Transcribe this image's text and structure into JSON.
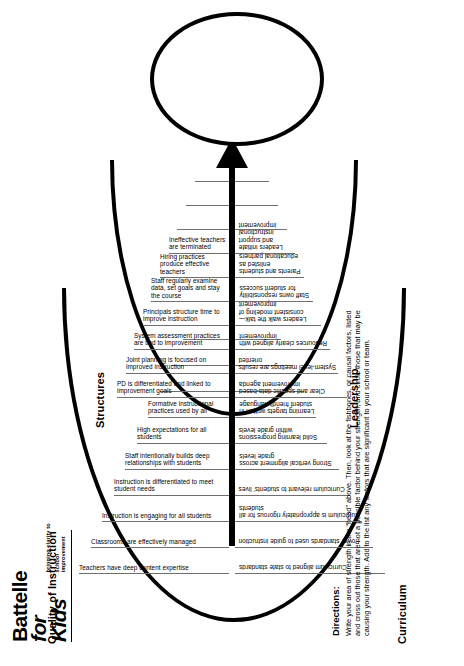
{
  "logo": {
    "line1": "Battelle",
    "line2": "for Kids",
    "tagline_1": "bringing clarity to",
    "tagline_2": "school improvement"
  },
  "diagram": {
    "type": "fishbone",
    "head_label": "",
    "categories": [
      {
        "name": "Quality of Instruction",
        "position": "upper-left",
        "items": [
          "Teachers have deep content expertise",
          "Classrooms are effectively managed",
          "Instruction is engaging for all students",
          "Instruction is differentiated to meet student needs",
          "Staff intentionally builds deep relationships with students",
          "High expectations for all students",
          "Formative instructional practices used by all",
          "",
          "",
          ""
        ]
      },
      {
        "name": "Structures",
        "position": "upper-right",
        "items": [
          "PD is differentiated and linked to improvement goals",
          "Joint planning is focused on improved instruction",
          "System assessment practices are tied to improvement",
          "Principals structure time to improve instruction",
          "Staff regularly examine data, set goals and stay the course",
          "Hiring practices produce effective teachers",
          "Ineffective teachers are terminated",
          "",
          "",
          ""
        ]
      },
      {
        "name": "Curriculum",
        "position": "lower-left",
        "items": [
          "Curriculum aligned to state standards",
          "Power standards used to guide instruction",
          "Curriculum is appropriately rigorous for all students",
          "Curriculum relevant to students' lives",
          "Strong vertical alignment across grade levels",
          "Solid learning progressions within grade levels",
          "Learning targets written in student friendly language",
          "",
          "",
          ""
        ]
      },
      {
        "name": "Leadership",
        "position": "lower-right",
        "items": [
          "Clear and specific data-based improvement agenda",
          "System-level meetings are results oriented",
          "Resources clearly aligned with improvement",
          "Leaders walk the talk—consistent modeling of improvement",
          "Staff owns responsibility for student success",
          "Parents and students enlisted as educational partners",
          "Leaders initiate and support instructional improvement",
          "",
          "",
          ""
        ]
      }
    ]
  },
  "directions": {
    "heading": "Directions:",
    "body": "Write your area of strength in the “head” above. Then, look at the fishbones, or causal factors, listed and cross out those that are not a possible factor behind your strength, and circle those that may be causing your strength. Add to the list any factors that are significant to your school or team."
  },
  "colors": {
    "ink": "#000000",
    "rule": "#6f6f6f",
    "paper": "#ffffff"
  }
}
